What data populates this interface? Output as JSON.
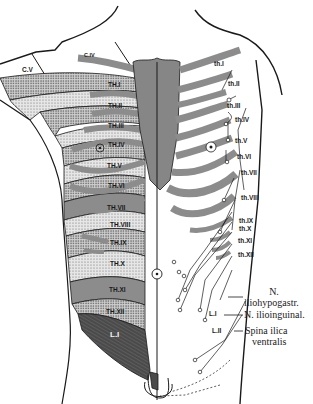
{
  "figure": {
    "colors": {
      "outline": "#1a1a1a",
      "light_stipple": "#d8d8d8",
      "medium_stipple": "#b8b8b8",
      "dark_stipple": "#9a9a9a",
      "lumbar_dark": "#5a5a5a",
      "rib": "#8c8c8c",
      "sternum": "#8a8a8a",
      "background": "#ffffff"
    },
    "left_side_dermatomes": [
      {
        "label": "C.V"
      },
      {
        "label": "C.IV"
      },
      {
        "label": "TH.I"
      },
      {
        "label": "TH.II"
      },
      {
        "label": "TH.III"
      },
      {
        "label": "TH.IV"
      },
      {
        "label": "TH.V"
      },
      {
        "label": "TH.VI"
      },
      {
        "label": "TH.VII"
      },
      {
        "label": "TH.VIII"
      },
      {
        "label": "TH.IX"
      },
      {
        "label": "TH.X"
      },
      {
        "label": "TH.XI"
      },
      {
        "label": "TH.XII"
      },
      {
        "label": "L.I"
      }
    ],
    "right_side_nerves": [
      {
        "label": "th.I"
      },
      {
        "label": "th.II"
      },
      {
        "label": "th.III"
      },
      {
        "label": "th.IV"
      },
      {
        "label": "th.V"
      },
      {
        "label": "th.VI"
      },
      {
        "label": "th.VII"
      },
      {
        "label": "th.VIII"
      },
      {
        "label": "th.IX"
      },
      {
        "label": "th.X"
      },
      {
        "label": "th.XI"
      },
      {
        "label": "th.XII"
      },
      {
        "label": "L.I"
      },
      {
        "label": "L.II"
      }
    ],
    "annotations": {
      "iliohypogastric_line1": "N.",
      "iliohypogastric_line2": "iliohypogastr.",
      "ilioinguinal": "N. ilioinguinal.",
      "spina_line1": "Spina ilica",
      "spina_line2": "ventralis"
    }
  }
}
